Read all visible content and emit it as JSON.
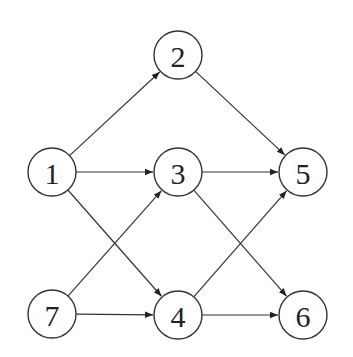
{
  "diagram": {
    "type": "directed-graph",
    "nodes": [
      {
        "id": "1",
        "label": "1",
        "x": 52,
        "y": 172
      },
      {
        "id": "2",
        "label": "2",
        "x": 178,
        "y": 55
      },
      {
        "id": "3",
        "label": "3",
        "x": 178,
        "y": 172
      },
      {
        "id": "4",
        "label": "4",
        "x": 178,
        "y": 315
      },
      {
        "id": "5",
        "label": "5",
        "x": 303,
        "y": 172
      },
      {
        "id": "6",
        "label": "6",
        "x": 303,
        "y": 315
      },
      {
        "id": "7",
        "label": "7",
        "x": 52,
        "y": 314
      }
    ],
    "edges": [
      {
        "from": "1",
        "to": "2"
      },
      {
        "from": "1",
        "to": "3"
      },
      {
        "from": "1",
        "to": "4"
      },
      {
        "from": "2",
        "to": "5"
      },
      {
        "from": "3",
        "to": "5"
      },
      {
        "from": "3",
        "to": "6"
      },
      {
        "from": "7",
        "to": "3"
      },
      {
        "from": "7",
        "to": "4"
      },
      {
        "from": "4",
        "to": "5"
      },
      {
        "from": "4",
        "to": "6"
      }
    ],
    "style": {
      "node_radius": 24,
      "stroke_color": "#333333",
      "fill_color": "#ffffff"
    }
  }
}
